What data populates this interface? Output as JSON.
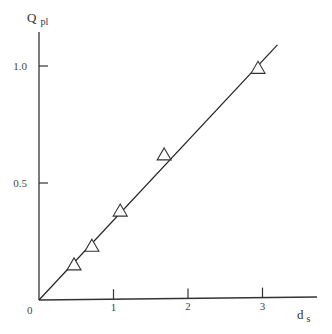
{
  "chart_data": {
    "type": "scatter",
    "title": "",
    "xlabel": "d",
    "xlabel_sub": "s",
    "ylabel": "Q",
    "ylabel_sub": "pl",
    "xlim": [
      0,
      3.7
    ],
    "ylim": [
      0,
      1.2
    ],
    "x_ticks": [
      1,
      2,
      3
    ],
    "x_tick_labels": [
      "1",
      "2",
      "3"
    ],
    "y_ticks": [
      0.5,
      1.0
    ],
    "y_tick_labels": [
      "0.5",
      "1.0"
    ],
    "origin_label": "0",
    "grid": false,
    "legend": null,
    "series": [
      {
        "name": "data",
        "marker": "open-triangle",
        "x": [
          0.47,
          0.71,
          1.09,
          1.68,
          2.94
        ],
        "y": [
          0.15,
          0.23,
          0.38,
          0.62,
          0.99
        ]
      },
      {
        "name": "fit",
        "style": "line",
        "x": [
          0,
          3.2
        ],
        "y": [
          0,
          1.09
        ]
      }
    ]
  }
}
